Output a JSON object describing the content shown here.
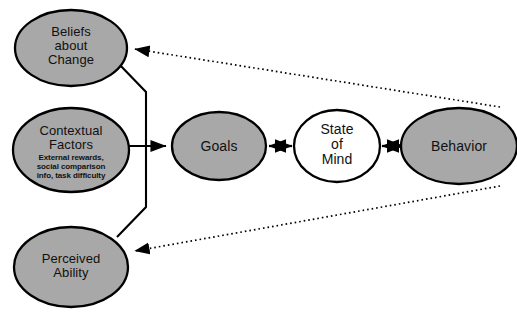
{
  "diagram": {
    "background_color": "#ffffff",
    "node_fill_gray": "#a8a8a8",
    "node_fill_white": "#ffffff",
    "stroke_color": "#000000",
    "nodes": [
      {
        "id": "beliefs-about-change",
        "label": "Beliefs\nabout\nChange",
        "line1": "Beliefs",
        "line2": "about",
        "line3": "Change",
        "fill": "#a8a8a8",
        "cx": 71,
        "cy": 48,
        "rx": 56,
        "ry": 38
      },
      {
        "id": "contextual-factors",
        "label": "Contextual\nFactors",
        "line1": "Contextual",
        "line2": "Factors",
        "sub": "External rewards,\nsocial comparison\ninfo, task difficulty",
        "sub_line1": "External rewards,",
        "sub_line2": "social comparison",
        "sub_line3": "info, task difficulty",
        "fill": "#a8a8a8",
        "cx": 71,
        "cy": 150,
        "rx": 58,
        "ry": 42
      },
      {
        "id": "perceived-ability",
        "label": "Perceived\nAbility",
        "line1": "Perceived",
        "line2": "Ability",
        "fill": "#a8a8a8",
        "cx": 71,
        "cy": 267,
        "rx": 57,
        "ry": 40
      },
      {
        "id": "goals",
        "label": "Goals",
        "line1": "Goals",
        "fill": "#a8a8a8",
        "cx": 219,
        "cy": 146,
        "rx": 47,
        "ry": 34
      },
      {
        "id": "state-of-mind",
        "label": "State\nof\nMind",
        "line1": "State",
        "line2": "of",
        "line3": "Mind",
        "fill": "#ffffff",
        "cx": 337,
        "cy": 146,
        "rx": 43,
        "ry": 36
      },
      {
        "id": "behavior",
        "label": "Behavior",
        "line1": "Behavior",
        "fill": "#a8a8a8",
        "cx": 459,
        "cy": 146,
        "rx": 58,
        "ry": 38
      }
    ],
    "edges": [
      {
        "id": "contextual-factors-to-goals",
        "from": "contextual-factors",
        "to": "goals",
        "style": "solid",
        "arrow": "single"
      },
      {
        "id": "beliefs-to-goals-bracket",
        "from": "beliefs-about-change",
        "to": "goals",
        "style": "solid",
        "arrow": "none"
      },
      {
        "id": "perceived-ability-to-goals-bracket",
        "from": "perceived-ability",
        "to": "goals",
        "style": "solid",
        "arrow": "none"
      },
      {
        "id": "goals-state-of-mind",
        "from": "goals",
        "to": "state-of-mind",
        "style": "solid",
        "arrow": "double"
      },
      {
        "id": "state-of-mind-behavior",
        "from": "state-of-mind",
        "to": "behavior",
        "style": "solid",
        "arrow": "double"
      },
      {
        "id": "behavior-to-beliefs-feedback",
        "from": "behavior",
        "to": "beliefs-about-change",
        "style": "dotted",
        "arrow": "single"
      },
      {
        "id": "behavior-to-perceived-ability-feedback",
        "from": "behavior",
        "to": "perceived-ability",
        "style": "dotted",
        "arrow": "single"
      }
    ]
  }
}
